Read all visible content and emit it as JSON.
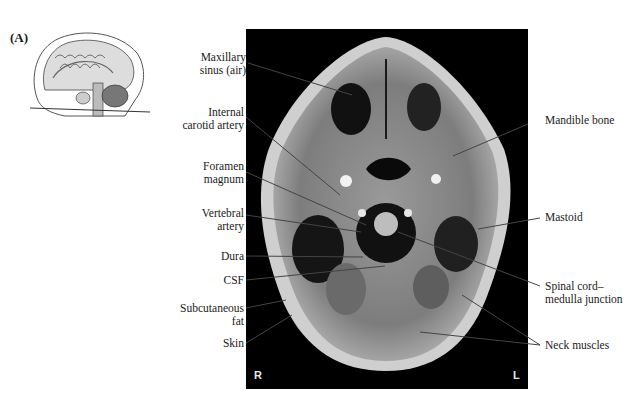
{
  "figure": {
    "panel_label": "(A)",
    "orientation": {
      "right": "R",
      "left": "L"
    }
  },
  "labels_left": [
    {
      "id": "maxillary-sinus",
      "lines": [
        "Maxillary",
        "sinus (air)"
      ]
    },
    {
      "id": "internal-carotid-artery",
      "lines": [
        "Internal",
        "carotid artery"
      ]
    },
    {
      "id": "foramen-magnum",
      "lines": [
        "Foramen",
        "magnum"
      ]
    },
    {
      "id": "vertebral-artery",
      "lines": [
        "Vertebral",
        "artery"
      ]
    },
    {
      "id": "dura",
      "lines": [
        "Dura"
      ]
    },
    {
      "id": "csf",
      "lines": [
        "CSF"
      ]
    },
    {
      "id": "subcutaneous-fat",
      "lines": [
        "Subcutaneous",
        "fat"
      ]
    },
    {
      "id": "skin",
      "lines": [
        "Skin"
      ]
    }
  ],
  "labels_right": [
    {
      "id": "mandible-bone",
      "lines": [
        "Mandible bone"
      ]
    },
    {
      "id": "mastoid",
      "lines": [
        "Mastoid"
      ]
    },
    {
      "id": "spinal-cord-medulla-junction",
      "lines": [
        "Spinal cord–",
        "medulla junction"
      ]
    },
    {
      "id": "neck-muscles",
      "lines": [
        "Neck muscles"
      ]
    }
  ]
}
